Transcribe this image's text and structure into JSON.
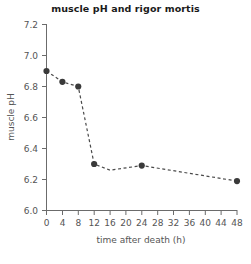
{
  "chart_data": {
    "type": "line",
    "title": "muscle pH and rigor mortis",
    "xlabel": "time after death (h)",
    "ylabel": "muscle pH",
    "xlim": [
      0,
      48
    ],
    "ylim": [
      6.0,
      7.2
    ],
    "xticks": [
      0,
      4,
      8,
      12,
      16,
      20,
      24,
      28,
      32,
      36,
      40,
      44,
      48
    ],
    "xtick_labels": [
      "0",
      "4",
      "8",
      "12",
      "16",
      "20",
      "24",
      "28",
      "32",
      "36",
      "40",
      "44",
      "48"
    ],
    "yticks": [
      6.0,
      6.2,
      6.4,
      6.6,
      6.8,
      7.0,
      7.2
    ],
    "ytick_labels": [
      "6.0",
      "6.2",
      "6.4",
      "6.6",
      "6.8",
      "7.0",
      "7.2"
    ],
    "grid": false,
    "legend": "none",
    "line_style": "dashed",
    "marker": "circle",
    "marker_color": "#3a3a3a",
    "line_color": "#4a4a4a",
    "x": [
      0,
      4,
      8,
      12,
      16,
      24,
      48
    ],
    "values": [
      6.9,
      6.83,
      6.8,
      6.3,
      6.26,
      6.29,
      6.19
    ],
    "series": [
      {
        "name": "muscle pH",
        "x": [
          0,
          4,
          8,
          12,
          16,
          24,
          48
        ],
        "values": [
          6.9,
          6.83,
          6.8,
          6.3,
          6.26,
          6.29,
          6.19
        ],
        "markers_shown": [
          true,
          true,
          true,
          true,
          false,
          true,
          true
        ]
      }
    ]
  },
  "axes": {
    "y_axis_label": "muscle pH",
    "x_axis_label": "time after death (h)"
  }
}
